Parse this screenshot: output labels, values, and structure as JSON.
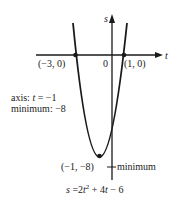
{
  "diagram": {
    "axes": {
      "horizontal_label": "t",
      "vertical_label": "s",
      "origin_label": "0"
    },
    "points": {
      "left_intercept": "(−3, 0)",
      "right_intercept": "(1, 0)",
      "vertex": "(−1, −8)"
    },
    "annotations": {
      "axis_line": "axis: t = −1",
      "axis_prefix": "axis: ",
      "axis_var": "t",
      "axis_value": " = −1",
      "minimum_line": "minimum: −8",
      "vertex_label": "minimum"
    },
    "equation": {
      "full": "s = 2t² + 4t − 6",
      "lhs": "s",
      "mid": " =2",
      "t1": "t",
      "sup": "2",
      "plus": " + 4",
      "t2": "t",
      "tail": " − 6"
    },
    "colors": {
      "ink": "#1a1a1a",
      "background": "#ffffff"
    }
  }
}
